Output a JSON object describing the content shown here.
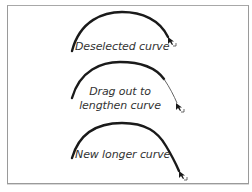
{
  "panels": [
    {
      "label": "Deselected curve",
      "state": "deselected"
    },
    {
      "label_lines": [
        "Drag out to",
        "lengthen curve"
      ],
      "state": "dragging"
    },
    {
      "label": "New longer curve",
      "state": "lengthened"
    }
  ],
  "colors": {
    "curve": "#1a1a1a",
    "frame": "#9a9a9a",
    "text": "#333333",
    "background": "#ffffff"
  },
  "icons": {
    "cursor": "pen-tool-extend-cursor"
  }
}
